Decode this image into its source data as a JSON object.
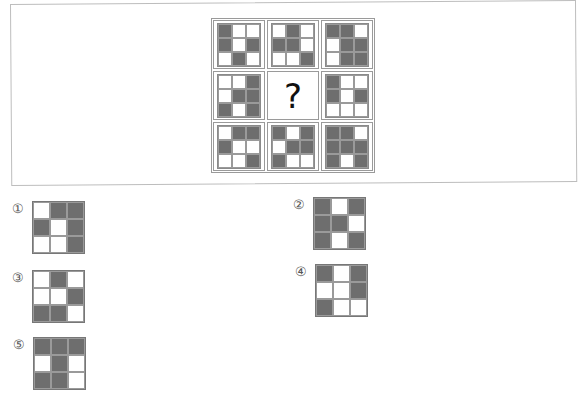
{
  "puzzle": {
    "question_mark": "?",
    "fill_color": "#6e6e6e",
    "matrix": [
      [
        [
          1,
          0,
          0
        ],
        [
          1,
          0,
          1
        ],
        [
          0,
          1,
          0
        ]
      ],
      [
        [
          0,
          1,
          0
        ],
        [
          1,
          1,
          0
        ],
        [
          0,
          0,
          1
        ]
      ],
      [
        [
          1,
          1,
          0
        ],
        [
          0,
          1,
          1
        ],
        [
          0,
          1,
          1
        ]
      ],
      [
        [
          0,
          0,
          1
        ],
        [
          0,
          1,
          1
        ],
        [
          1,
          0,
          1
        ]
      ],
      null,
      [
        [
          1,
          0,
          0
        ],
        [
          1,
          0,
          1
        ],
        [
          0,
          0,
          0
        ]
      ],
      [
        [
          0,
          1,
          1
        ],
        [
          1,
          0,
          0
        ],
        [
          0,
          0,
          1
        ]
      ],
      [
        [
          1,
          0,
          1
        ],
        [
          0,
          1,
          1
        ],
        [
          1,
          0,
          0
        ]
      ],
      [
        [
          1,
          1,
          0
        ],
        [
          1,
          1,
          1
        ],
        [
          1,
          0,
          1
        ]
      ]
    ]
  },
  "options": [
    {
      "label": "①",
      "pattern": [
        [
          0,
          1,
          1
        ],
        [
          1,
          0,
          1
        ],
        [
          0,
          0,
          1
        ]
      ]
    },
    {
      "label": "②",
      "pattern": [
        [
          1,
          0,
          1
        ],
        [
          1,
          1,
          0
        ],
        [
          1,
          0,
          1
        ]
      ]
    },
    {
      "label": "③",
      "pattern": [
        [
          0,
          1,
          0
        ],
        [
          0,
          0,
          1
        ],
        [
          1,
          1,
          0
        ]
      ]
    },
    {
      "label": "④",
      "pattern": [
        [
          1,
          0,
          1
        ],
        [
          0,
          0,
          1
        ],
        [
          1,
          0,
          0
        ]
      ]
    },
    {
      "label": "⑤",
      "pattern": [
        [
          1,
          1,
          1
        ],
        [
          0,
          1,
          0
        ],
        [
          1,
          1,
          0
        ]
      ]
    }
  ]
}
